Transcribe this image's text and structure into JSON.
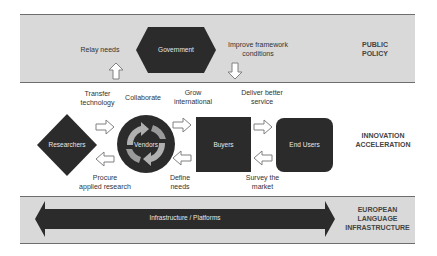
{
  "bands": {
    "public_policy": {
      "label_line1": "PUBLIC",
      "label_line2": "POLICY"
    },
    "innovation": {
      "label_line1": "INNOVATION",
      "label_line2": "ACCELERATION"
    },
    "infrastructure": {
      "label_line1": "EUROPEAN",
      "label_line2": "LANGUAGE",
      "label_line3": "INFRASTRUCTURE"
    }
  },
  "nodes": {
    "government": "Government",
    "researchers": "Researchers",
    "vendors": "Vendors",
    "buyers": "Buyers",
    "end_users": "End Users",
    "infrastructure": "Infrastructure / Platforms"
  },
  "edge_labels": {
    "relay_needs": "Relay needs",
    "improve_framework_1": "Improve framework",
    "improve_framework_2": "conditions",
    "transfer_tech_1": "Transfer",
    "transfer_tech_2": "technology",
    "collaborate": "Collaborate",
    "grow_intl_1": "Grow",
    "grow_intl_2": "international",
    "deliver_1": "Deliver better",
    "deliver_2": "service",
    "procure_1": "Procure",
    "procure_2": "applied research",
    "define_1": "Define",
    "define_2": "needs",
    "survey_1": "Survey the",
    "survey_2": "market"
  },
  "colors": {
    "band_fill": "#d9d9d9",
    "node_fill": "#2b2b2b",
    "arrow_outline": "#808080",
    "cycle_arrow": "#b0b0b0"
  }
}
